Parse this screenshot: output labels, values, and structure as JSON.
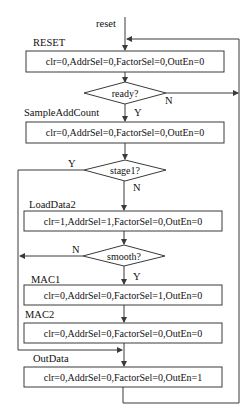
{
  "diagram": {
    "type": "flowchart",
    "entry_label": "reset",
    "states": [
      {
        "name": "RESET",
        "action": "clr=0,AddrSel=0,FactorSel=0,OutEn=0"
      },
      {
        "name": "SampleAddCount",
        "action": "clr=0,AddrSel=0,FactorSel=0,OutEn=0"
      },
      {
        "name": "LoadData2",
        "action": "clr=1,AddrSel=1,FactorSel=0,OutEn=0"
      },
      {
        "name": "MAC1",
        "action": "clr=0,AddrSel=0,FactorSel=1,OutEn=0"
      },
      {
        "name": "MAC2",
        "action": "clr=0,AddrSel=0,FactorSel=0,OutEn=0"
      },
      {
        "name": "OutData",
        "action": "clr=0,AddrSel=0,FactorSel=0,OutEn=1"
      }
    ],
    "decisions": [
      {
        "name": "ready?",
        "yes": "Y",
        "no": "N"
      },
      {
        "name": "stage1?",
        "yes": "Y",
        "no": "N"
      },
      {
        "name": "smooth?",
        "yes": "Y",
        "no": "N"
      }
    ],
    "edges": [
      {
        "from": "reset",
        "to": "RESET"
      },
      {
        "from": "RESET",
        "to": "ready?"
      },
      {
        "from": "ready?",
        "to": "SampleAddCount",
        "label": "Y"
      },
      {
        "from": "ready?",
        "to": "RESET",
        "label": "N"
      },
      {
        "from": "SampleAddCount",
        "to": "stage1?"
      },
      {
        "from": "stage1?",
        "to": "LoadData2",
        "label": "N"
      },
      {
        "from": "stage1?",
        "to": "OutData",
        "label": "Y"
      },
      {
        "from": "LoadData2",
        "to": "smooth?"
      },
      {
        "from": "smooth?",
        "to": "MAC1",
        "label": "Y"
      },
      {
        "from": "smooth?",
        "to": "OutData",
        "label": "N"
      },
      {
        "from": "MAC1",
        "to": "MAC2"
      },
      {
        "from": "MAC2",
        "to": "OutData"
      },
      {
        "from": "OutData",
        "to": "RESET"
      }
    ]
  }
}
